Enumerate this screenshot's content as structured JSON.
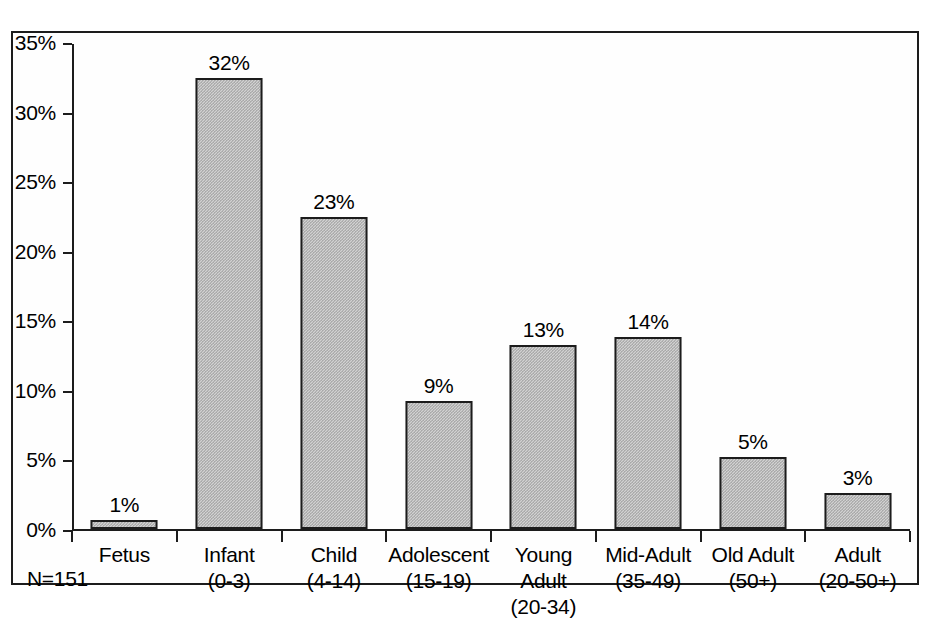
{
  "chart_data": {
    "type": "bar",
    "title": "",
    "subtitle": "",
    "xlabel": "",
    "ylabel": "",
    "categories": [
      "Fetus",
      "Infant",
      "Child",
      "Adolescent",
      "Young Adult",
      "Mid-Adult",
      "Old Adult",
      "Adult"
    ],
    "category_ranges": [
      "",
      "(0-3)",
      "(4-14)",
      "(15-19)",
      "(20-34)",
      "(35-49)",
      "(50+)",
      "(20-50+)"
    ],
    "values": [
      0.65,
      32.4,
      22.4,
      9.2,
      13.2,
      13.8,
      5.2,
      2.6
    ],
    "data_labels": [
      "1%",
      "32%",
      "23%",
      "9%",
      "13%",
      "14%",
      "5%",
      "3%"
    ],
    "ylim": [
      0,
      35
    ],
    "yticks": [
      0,
      5,
      10,
      15,
      20,
      25,
      30,
      35
    ],
    "ytick_labels": [
      "0%",
      "5%",
      "10%",
      "15%",
      "20%",
      "25%",
      "30%",
      "35%"
    ],
    "grid": false,
    "legend": false,
    "annotations": [
      "N=151"
    ],
    "bar_fill_color": "#c8c8c8",
    "bar_edge_color": "#1c1c1c",
    "axis_color": "#1c1c1c",
    "background_color": "#ffffff"
  },
  "annotation": {
    "sample_size": "N=151"
  }
}
